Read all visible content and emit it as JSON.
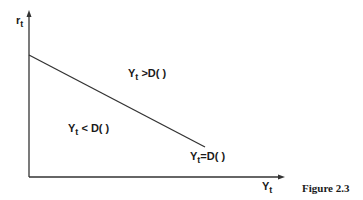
{
  "diagram": {
    "y_axis_label": {
      "main": "r",
      "sub": "t"
    },
    "x_axis_label": {
      "main": "Y",
      "sub": "t"
    },
    "region_above": {
      "main": "Y",
      "sub": "t",
      "rel": " >D( )"
    },
    "region_below": {
      "main": "Y",
      "sub": "t",
      "rel": " < D( )"
    },
    "line_label": {
      "main": "Y",
      "sub": "t",
      "rel": "=D( )"
    },
    "caption": "Figure 2.3",
    "line_color": "#333333"
  }
}
